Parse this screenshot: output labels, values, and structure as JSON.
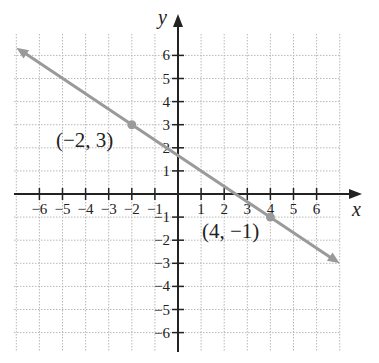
{
  "chart_data": {
    "type": "line",
    "title": "",
    "xlabel": "x",
    "ylabel": "y",
    "xlim": [
      -7,
      7
    ],
    "ylim": [
      -7,
      7
    ],
    "grid": true,
    "x_ticks": [
      "-6",
      "-5",
      "-4",
      "-3",
      "-2",
      "-1",
      "1",
      "2",
      "3",
      "4",
      "5",
      "6"
    ],
    "y_ticks": [
      "6",
      "5",
      "4",
      "3",
      "2",
      "1",
      "-1",
      "-2",
      "-3",
      "-4",
      "-5",
      "-6"
    ],
    "series": [
      {
        "name": "line through (-2,3) and (4,-1)",
        "slope": -0.6667,
        "intercept": 1.6667,
        "x": [
          -7,
          7
        ],
        "y": [
          6.33,
          -3
        ]
      }
    ],
    "points": [
      {
        "x": -2,
        "y": 3,
        "label": "(−2, 3)"
      },
      {
        "x": 4,
        "y": -1,
        "label": "(4, −1)"
      }
    ],
    "colors": {
      "line": "#9a9a9a",
      "axis": "#222222",
      "grid": "#b8b8b8"
    }
  }
}
